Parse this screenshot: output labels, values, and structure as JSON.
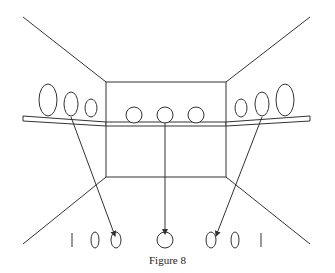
{
  "figure": {
    "caption": "Figure 8",
    "stroke_color": "#333333",
    "background": "#ffffff"
  },
  "room": {
    "back_wall": {
      "x": 106,
      "y": 82,
      "width": 120,
      "height": 95
    },
    "perspective_lines": [
      {
        "name": "top-left",
        "x1": 23,
        "y1": 17,
        "x2": 106,
        "y2": 82
      },
      {
        "name": "top-right",
        "x1": 310,
        "y1": 17,
        "x2": 226,
        "y2": 82
      },
      {
        "name": "bottom-left",
        "x1": 106,
        "y1": 177,
        "x2": 23,
        "y2": 244
      },
      {
        "name": "bottom-right",
        "x1": 226,
        "y1": 177,
        "x2": 310,
        "y2": 244
      }
    ]
  },
  "shelf_objects": {
    "left": [
      {
        "cx": 48,
        "cy": 100,
        "rx": 9,
        "ry": 16
      },
      {
        "cx": 71,
        "cy": 104,
        "rx": 7,
        "ry": 12
      },
      {
        "cx": 91,
        "cy": 108,
        "rx": 6,
        "ry": 9
      }
    ],
    "center": [
      {
        "cx": 134,
        "cy": 115,
        "rx": 8,
        "ry": 8
      },
      {
        "cx": 165,
        "cy": 115,
        "rx": 8,
        "ry": 8
      },
      {
        "cx": 196,
        "cy": 115,
        "rx": 8,
        "ry": 8
      }
    ],
    "right": [
      {
        "cx": 241,
        "cy": 108,
        "rx": 6,
        "ry": 9
      },
      {
        "cx": 262,
        "cy": 104,
        "rx": 7,
        "ry": 12
      },
      {
        "cx": 285,
        "cy": 100,
        "rx": 9,
        "ry": 16
      }
    ]
  },
  "projections": [
    {
      "from": [
        71,
        117
      ],
      "to": [
        115,
        236
      ]
    },
    {
      "from": [
        165,
        123
      ],
      "to": [
        165,
        234
      ]
    },
    {
      "from": [
        262,
        117
      ],
      "to": [
        216,
        236
      ]
    }
  ],
  "projected_row": [
    {
      "type": "bar",
      "x": 72
    },
    {
      "type": "oval",
      "cx": 95,
      "rx": 4,
      "ry": 8
    },
    {
      "type": "oval",
      "cx": 116,
      "rx": 5,
      "ry": 8
    },
    {
      "type": "circle",
      "cx": 165,
      "rx": 8,
      "ry": 8
    },
    {
      "type": "oval",
      "cx": 211,
      "rx": 5,
      "ry": 8
    },
    {
      "type": "oval",
      "cx": 235,
      "rx": 4,
      "ry": 8
    },
    {
      "type": "bar",
      "x": 261
    }
  ]
}
